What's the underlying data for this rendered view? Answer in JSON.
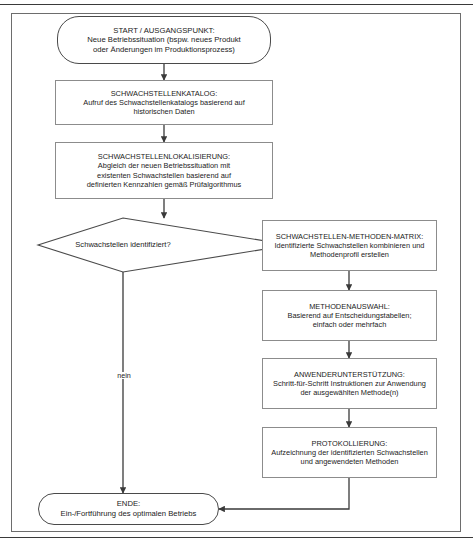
{
  "diagram": {
    "title_present": false,
    "colors": {
      "background": "#ffffff",
      "terminator_stroke": "#4a4a4a",
      "process_stroke": "#8c8c8c",
      "connector_stroke": "#3a3a3a",
      "frame_stroke": "#6d6d6d",
      "text": "#1b1b1b"
    },
    "nodes": {
      "start": {
        "shape": "terminator",
        "title": "START / AUSGANGSPUNKT:",
        "body": "Neue Betriebssituation (bspw. neues Produkt\noder Änderungen im Produktionsprozess)",
        "text": "START / AUSGANGSPUNKT:\nNeue Betriebssituation (bspw. neues Produkt\noder Änderungen im Produktionsprozess)"
      },
      "katalog": {
        "shape": "process",
        "title": "SCHWACHSTELLENKATALOG:",
        "body": "Aufruf des Schwachstellenkatalogs basierend auf\nhistorischen Daten",
        "text": "SCHWACHSTELLENKATALOG:\nAufruf des Schwachstellenkatalogs basierend auf\nhistorischen Daten"
      },
      "lokalisierung": {
        "shape": "process",
        "title": "SCHWACHSTELLENLOKALISIERUNG:",
        "body": "Abgleich der neuen Betriebssituation mit\nexistenten Schwachstellen basierend auf\ndefinierten Kennzahlen gemäß Prüfalgorithmus",
        "text": "SCHWACHSTELLENLOKALISIERUNG:\nAbgleich der neuen Betriebssituation mit\nexistenten Schwachstellen basierend auf\ndefinierten Kennzahlen gemäß Prüfalgorithmus"
      },
      "decision": {
        "shape": "decision",
        "text": "Schwachstellen identifiziert?"
      },
      "matrix": {
        "shape": "process",
        "title": "SCHWACHSTELLEN-METHODEN-MATRIX:",
        "body": "Identifizierte Schwachstellen kombinieren und\nMethodenprofil erstellen",
        "text": "SCHWACHSTELLEN-METHODEN-MATRIX:\nIdentifizierte Schwachstellen kombinieren und\nMethodenprofil erstellen"
      },
      "methodenauswahl": {
        "shape": "process",
        "title": "METHODENAUSWAHL:",
        "body": "Basierend auf Entscheidungstabellen;\neinfach oder mehrfach",
        "text": "METHODENAUSWAHL:\nBasierend auf Entscheidungstabellen;\neinfach oder mehrfach"
      },
      "anwenderunterstuetzung": {
        "shape": "process",
        "title": "ANWENDERUNTERSTÜTZUNG:",
        "body": "Schritt-für-Schritt Instruktionen zur Anwendung\nder ausgewählten Methode(n)",
        "text": "ANWENDERUNTERSTÜTZUNG:\nSchritt-für-Schritt Instruktionen zur Anwendung\nder ausgewählten Methode(n)"
      },
      "protokollierung": {
        "shape": "process",
        "title": "PROTOKOLLIERUNG:",
        "body": "Aufzeichnung der identifizierten Schwachstellen\nund angewendeten Methoden",
        "text": "PROTOKOLLIERUNG:\nAufzeichnung der identifizierten Schwachstellen\nund angewendeten Methoden"
      },
      "ende": {
        "shape": "terminator",
        "title": "ENDE:",
        "body": "Ein-/Fortführung des optimalen Betriebs",
        "text": "ENDE:\nEin-/Fortführung des optimalen Betriebs"
      }
    },
    "edge_labels": {
      "yes": "ja",
      "no": "nein"
    }
  }
}
